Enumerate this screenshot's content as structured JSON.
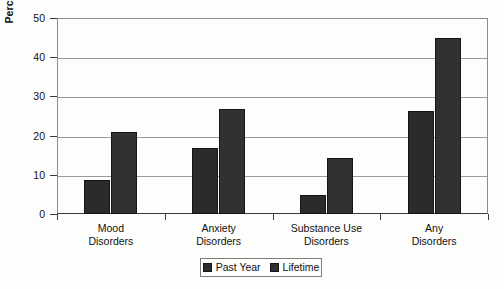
{
  "chart_data": {
    "type": "bar",
    "title": "",
    "xlabel": "",
    "ylabel": "Percentage with Disorders",
    "ylim": [
      0,
      50
    ],
    "yticks": [
      0,
      10,
      20,
      30,
      40,
      50
    ],
    "ytick_labels": [
      "0",
      "10",
      "20",
      "30",
      "40",
      "50"
    ],
    "grid": true,
    "legend_position": "bottom",
    "categories": [
      {
        "line1": "Mood",
        "line2": "Disorders"
      },
      {
        "line1": "Anxiety",
        "line2": "Disorders"
      },
      {
        "line1": "Substance Use",
        "line2": "Disorders"
      },
      {
        "line1": "Any",
        "line2": "Disorders"
      }
    ],
    "category_labels": [
      "Mood Disorders",
      "Anxiety Disorders",
      "Substance Use Disorders",
      "Any Disorders"
    ],
    "series": [
      {
        "name": "Past Year",
        "color": "#2b2b2b",
        "values": [
          8.6,
          16.8,
          4.9,
          26.4
        ]
      },
      {
        "name": "Lifetime",
        "color": "#313131",
        "values": [
          21.0,
          26.8,
          14.2,
          45.0
        ]
      }
    ]
  },
  "legend": {
    "entries": [
      {
        "label": "Past Year"
      },
      {
        "label": "Lifetime"
      }
    ]
  },
  "colors": {
    "bar_past_year": "#2b2b2b",
    "bar_lifetime": "#313131",
    "gridline": "#9a9a9a",
    "axis": "#3a3a3a",
    "plot_background": "#fdfdfc",
    "text": "#111111"
  }
}
